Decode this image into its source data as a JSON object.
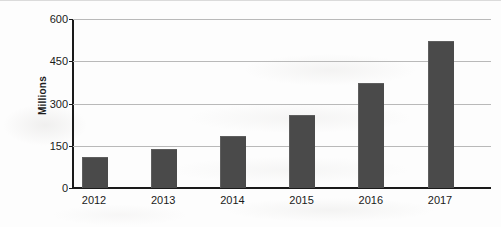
{
  "chart_data": {
    "type": "bar",
    "title": "",
    "subtitle": "",
    "xlabel": "",
    "ylabel": "Millions",
    "categories": [
      "2012",
      "2013",
      "2014",
      "2015",
      "2016",
      "2017"
    ],
    "values": [
      105,
      135,
      180,
      255,
      370,
      520
    ],
    "series": [
      {
        "name": "Millions",
        "values": [
          105,
          135,
          180,
          255,
          370,
          520
        ]
      }
    ],
    "ylim": [
      0,
      600
    ],
    "ytick_labels": [
      "0",
      "150",
      "300",
      "450",
      "600"
    ],
    "ytick_values": [
      0,
      150,
      300,
      450,
      600
    ],
    "grid": true,
    "grid_axis": "y",
    "legend": false,
    "legend_position": "none",
    "bar_color": "#4a4a4a",
    "gridline_color": "#b9b9b9",
    "axis_color": "#1a1a1a",
    "background_color": "#fdfdfd"
  }
}
